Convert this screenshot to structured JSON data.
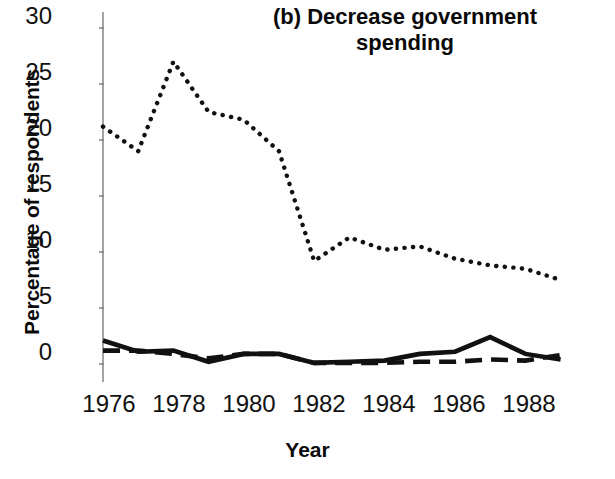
{
  "figure": {
    "title_line1": "(b) Decrease government",
    "title_line2": "spending",
    "ylabel": "Percentage of respondents",
    "xlabel": "Year"
  },
  "chart_data": {
    "type": "line",
    "title": "(b) Decrease government spending",
    "xlabel": "Year",
    "ylabel": "Percentage of respondents",
    "xlim": [
      1976,
      1989
    ],
    "ylim": [
      0,
      30
    ],
    "xticks": [
      1976,
      1978,
      1980,
      1982,
      1984,
      1986,
      1988
    ],
    "yticks": [
      0,
      5,
      10,
      15,
      20,
      25,
      30
    ],
    "grid": false,
    "legend": "none",
    "x": [
      1976,
      1977,
      1978,
      1979,
      1980,
      1981,
      1982,
      1983,
      1984,
      1985,
      1986,
      1987,
      1988,
      1989
    ],
    "series": [
      {
        "name": "dotted-series",
        "style": "dotted",
        "values": [
          21.2,
          19.0,
          27.0,
          22.5,
          21.8,
          19.0,
          9.2,
          11.3,
          10.2,
          10.5,
          9.4,
          8.8,
          8.5,
          7.5
        ]
      },
      {
        "name": "solid-series",
        "style": "solid",
        "values": [
          2.1,
          1.1,
          1.2,
          0.2,
          0.9,
          0.9,
          0.1,
          0.2,
          0.3,
          0.9,
          1.1,
          2.4,
          0.9,
          0.4
        ]
      },
      {
        "name": "dashed-series",
        "style": "dashed",
        "values": [
          1.2,
          1.2,
          0.9,
          0.5,
          0.9,
          0.9,
          0.1,
          0.1,
          0.1,
          0.2,
          0.2,
          0.4,
          0.3,
          0.8
        ]
      }
    ]
  },
  "yticklabels": [
    "30",
    "25",
    "20",
    "15",
    "10",
    "5",
    "0"
  ],
  "xticklabels": [
    "1976",
    "1978",
    "1980",
    "1982",
    "1984",
    "1986",
    "1988"
  ]
}
